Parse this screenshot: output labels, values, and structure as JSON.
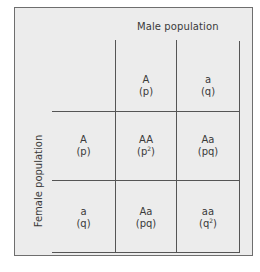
{
  "diagram": {
    "type": "punnett-square",
    "column_header": "Male population",
    "row_header": "Female population",
    "columns": [
      {
        "allele": "A",
        "freq": "(p)"
      },
      {
        "allele": "a",
        "freq": "(q)"
      }
    ],
    "rows": [
      {
        "allele": "A",
        "freq": "(p)"
      },
      {
        "allele": "a",
        "freq": "(q)"
      }
    ],
    "cells": [
      [
        {
          "genotype": "AA",
          "freq_base": "(p",
          "freq_sup": "2",
          "freq_end": ")"
        },
        {
          "genotype": "Aa",
          "freq_base": "(pq)",
          "freq_sup": "",
          "freq_end": ""
        }
      ],
      [
        {
          "genotype": "Aa",
          "freq_base": "(pq)",
          "freq_sup": "",
          "freq_end": ""
        },
        {
          "genotype": "aa",
          "freq_base": "(q",
          "freq_sup": "2",
          "freq_end": ")"
        }
      ]
    ]
  },
  "colors": {
    "background": "#ececec",
    "border": "#6e6e6e",
    "lines": "#555555",
    "text": "#3a3a3a"
  }
}
